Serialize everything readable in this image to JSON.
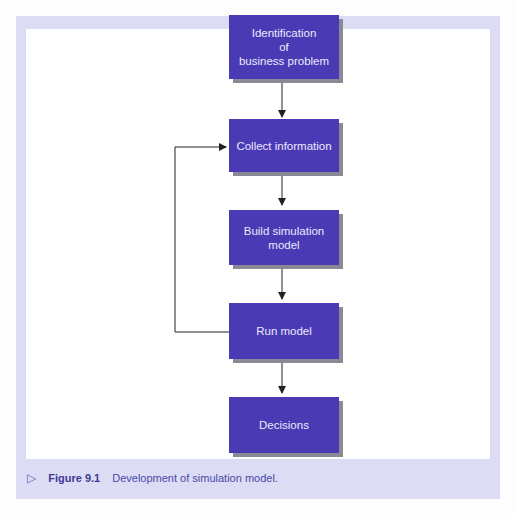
{
  "diagram": {
    "type": "flowchart",
    "nodes": [
      {
        "id": "identification",
        "label": "Identification\nof\nbusiness problem"
      },
      {
        "id": "collect",
        "label": "Collect information"
      },
      {
        "id": "build",
        "label": "Build simulation\nmodel"
      },
      {
        "id": "run",
        "label": "Run model"
      },
      {
        "id": "decisions",
        "label": "Decisions"
      }
    ],
    "edges": [
      {
        "from": "identification",
        "to": "collect"
      },
      {
        "from": "collect",
        "to": "build"
      },
      {
        "from": "build",
        "to": "run"
      },
      {
        "from": "run",
        "to": "decisions"
      },
      {
        "from": "run",
        "to": "collect",
        "type": "feedback-loop"
      }
    ]
  },
  "caption": {
    "marker": "▷",
    "label": "Figure 9.1",
    "text": "Development of simulation model."
  },
  "colors": {
    "node_fill": "#4a3ab4",
    "node_text": "#ece9ff",
    "frame": "#dcdcf4",
    "caption_text": "#3d3a96"
  }
}
